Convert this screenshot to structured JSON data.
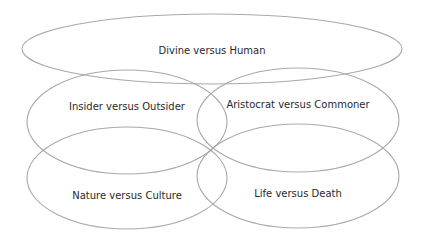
{
  "diagram": {
    "type": "overlapping-ellipses",
    "stroke_color": "#a8a8a8",
    "text_color": "#2a2a2a",
    "ellipses": [
      {
        "id": "divine-human",
        "label": "Divine versus Human",
        "cx": 212,
        "cy": 49,
        "rx": 190,
        "ry": 35,
        "label_x": 212,
        "label_y": 51
      },
      {
        "id": "insider-outsider",
        "label": "Insider versus Outsider",
        "cx": 127,
        "cy": 122,
        "rx": 100,
        "ry": 52,
        "label_x": 127,
        "label_y": 107
      },
      {
        "id": "aristocrat-commoner",
        "label": "Aristocrat versus Commoner",
        "cx": 298,
        "cy": 120,
        "rx": 101,
        "ry": 52,
        "label_x": 298,
        "label_y": 105
      },
      {
        "id": "nature-culture",
        "label": "Nature versus Culture",
        "cx": 127,
        "cy": 178,
        "rx": 100,
        "ry": 51,
        "label_x": 127,
        "label_y": 196
      },
      {
        "id": "life-death",
        "label": "Life versus Death",
        "cx": 298,
        "cy": 176,
        "rx": 101,
        "ry": 52,
        "label_x": 298,
        "label_y": 194
      }
    ]
  }
}
